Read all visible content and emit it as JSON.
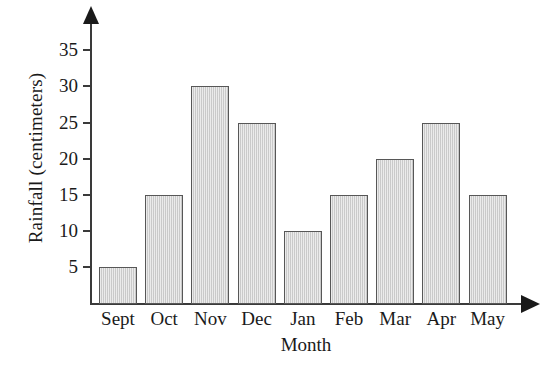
{
  "chart_data": {
    "type": "bar",
    "title": "",
    "xlabel": "Month",
    "ylabel": "Rainfall (centimeters)",
    "categories": [
      "Sept",
      "Oct",
      "Nov",
      "Dec",
      "Jan",
      "Feb",
      "Mar",
      "Apr",
      "May"
    ],
    "values": [
      5,
      15,
      30,
      25,
      10,
      15,
      20,
      25,
      15
    ],
    "yticks": [
      5,
      10,
      15,
      20,
      25,
      30,
      35
    ],
    "ytick_labels": [
      "5",
      "10",
      "15",
      "20",
      "25",
      "30",
      "35"
    ],
    "ylim": [
      0,
      38
    ],
    "grid": false,
    "legend": null,
    "series": [
      {
        "name": "Rainfall",
        "values": [
          5,
          15,
          30,
          25,
          10,
          15,
          20,
          25,
          15
        ]
      }
    ],
    "bar_fill_color": "#d3d3d3",
    "bar_border_color": "#575757",
    "axis_color": "#3a3a3a",
    "background_color": "#ffffff"
  },
  "axes": {
    "y_title": "Rainfall (centimeters)",
    "x_title": "Month"
  }
}
